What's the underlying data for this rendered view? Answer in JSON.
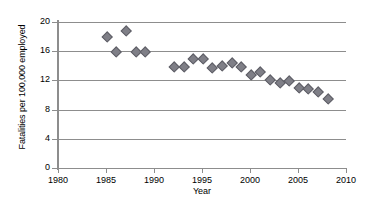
{
  "chart_data": {
    "type": "scatter",
    "title": "",
    "xlabel": "Year",
    "ylabel": "Fatalities per 100,000 employed",
    "xlim": [
      1980,
      2010
    ],
    "ylim": [
      0,
      20
    ],
    "xticks": [
      1980,
      1985,
      1990,
      1995,
      2000,
      2005,
      2010
    ],
    "yticks": [
      0,
      4,
      8,
      12,
      16,
      20
    ],
    "grid": "horizontal",
    "legend": "none",
    "marker": "diamond",
    "marker_color": "#7f7f87",
    "series": [
      {
        "name": "Fatality rate",
        "x": [
          1985,
          1986,
          1987,
          1988,
          1989,
          1992,
          1993,
          1994,
          1995,
          1996,
          1997,
          1998,
          1999,
          2000,
          2001,
          2002,
          2003,
          2004,
          2005,
          2006,
          2007,
          2008
        ],
        "values": [
          18.0,
          16.0,
          18.9,
          16.0,
          16.0,
          14.0,
          14.0,
          15.0,
          15.0,
          13.8,
          14.1,
          14.5,
          13.9,
          12.9,
          13.3,
          12.1,
          11.8,
          12.0,
          11.1,
          10.9,
          10.5,
          9.6
        ]
      }
    ]
  }
}
